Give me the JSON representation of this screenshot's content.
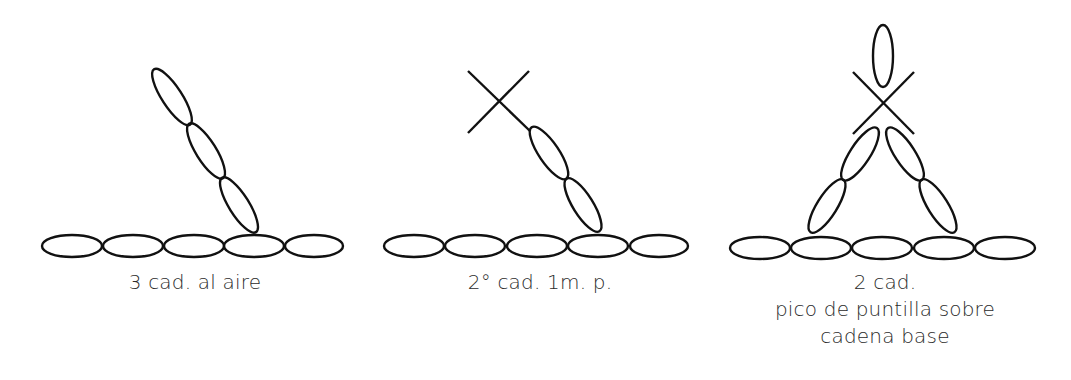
{
  "colors": {
    "stroke": "#111111",
    "text": "#2b2b2b",
    "background": "#ffffff"
  },
  "panels": [
    {
      "id": "panel-1",
      "caption": [
        "3 cad. al aire"
      ],
      "base_chain_count": 5,
      "rising_chains": 3,
      "symbols": [
        "chain-stitch"
      ]
    },
    {
      "id": "panel-2",
      "caption": [
        "2° cad. 1m. p."
      ],
      "base_chain_count": 5,
      "rising_chains": 2,
      "symbols": [
        "chain-stitch",
        "single-crochet-x"
      ]
    },
    {
      "id": "panel-3",
      "caption": [
        "2 cad.",
        "pico de puntilla sobre",
        "cadena base"
      ],
      "base_chain_count": 5,
      "rising_chains": 4,
      "symbols": [
        "chain-stitch",
        "single-crochet-x",
        "vertical-chain"
      ]
    }
  ]
}
